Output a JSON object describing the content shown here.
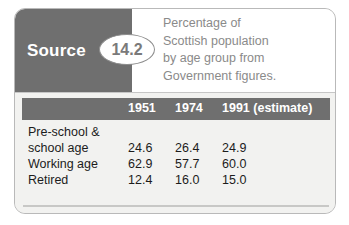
{
  "source": {
    "label": "Source",
    "number": "14.2"
  },
  "caption": {
    "line1": "Percentage of",
    "line2": "Scottish population",
    "line3": "by age group from",
    "line4": "Government figures."
  },
  "table": {
    "columns": [
      "",
      "1951",
      "1974",
      "1991 (estimate)"
    ],
    "rows": [
      {
        "label": "Pre-school &",
        "v1": "",
        "v2": "",
        "v3": ""
      },
      {
        "label": "school age",
        "v1": "24.6",
        "v2": "26.4",
        "v3": "24.9"
      },
      {
        "label": "Working age",
        "v1": "62.9",
        "v2": "57.7",
        "v3": "60.0"
      },
      {
        "label": "Retired",
        "v1": "12.4",
        "v2": "16.0",
        "v3": "15.0"
      }
    ]
  },
  "colors": {
    "band_gray": "#6f6f6f",
    "body_gray": "#f2f2f0",
    "caption_gray": "#8a8a8a",
    "border_gray": "#b9b9b9"
  },
  "chart_data": {
    "type": "table",
    "title": "Percentage of Scottish population by age group from Government figures.",
    "categories": [
      "Pre-school & school age",
      "Working age",
      "Retired"
    ],
    "series": [
      {
        "name": "1951",
        "values": [
          24.6,
          62.9,
          12.4
        ]
      },
      {
        "name": "1974",
        "values": [
          26.4,
          57.7,
          16.0
        ]
      },
      {
        "name": "1991 (estimate)",
        "values": [
          24.9,
          60.0,
          15.0
        ]
      }
    ],
    "xlabel": "Age group",
    "ylabel": "Percentage of population",
    "ylim": [
      0,
      100
    ],
    "grid": false,
    "legend": "none"
  }
}
